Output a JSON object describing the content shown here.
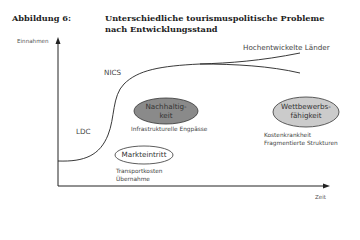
{
  "figure": {
    "label": "Abbildung 6:",
    "title_line1": "Unterschiedliche tourismuspolitische Probleme",
    "title_line2": "nach Entwicklungsstand"
  },
  "axes": {
    "y_label": "Einnahmen",
    "x_label": "Zeit"
  },
  "stages": {
    "ldc": "LDC",
    "nics": "NICS",
    "developed": "Hochentwickelte Länder"
  },
  "problems": {
    "market_entry": {
      "label": "Markteintritt",
      "notes": [
        "Transportkosten",
        "Übernahme"
      ],
      "fill": "#ffffff"
    },
    "sustainability": {
      "label_line1": "Nachhaltig-",
      "label_line2": "keit",
      "notes": [
        "Infrastrukturelle Engpässe"
      ],
      "fill": "#8a8a8a"
    },
    "competitiveness": {
      "label_line1": "Wettbewerbs-",
      "label_line2": "fähigkeit",
      "notes": [
        "Kostenkrankheit",
        "Fragmentierte Strukturen"
      ],
      "fill": "#c8c8c8"
    }
  }
}
